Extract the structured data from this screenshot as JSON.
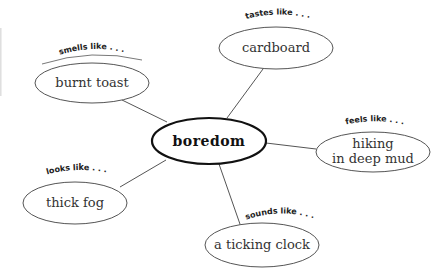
{
  "diagram": {
    "type": "concept-web",
    "center": {
      "label": "boredom",
      "cx": 209,
      "cy": 141,
      "rx": 57,
      "ry": 23
    },
    "nodes": [
      {
        "id": "smells",
        "prompt": "smells like . . .",
        "lines": [
          "burnt toast"
        ],
        "cx": 92,
        "cy": 83,
        "rx": 57,
        "ry": 20
      },
      {
        "id": "tastes",
        "prompt": "tastes like . . .",
        "lines": [
          "cardboard"
        ],
        "cx": 276,
        "cy": 48,
        "rx": 57,
        "ry": 21
      },
      {
        "id": "feels",
        "prompt": "feels like . . .",
        "lines": [
          "hiking",
          "in deep mud"
        ],
        "cx": 373,
        "cy": 152,
        "rx": 57,
        "ry": 20
      },
      {
        "id": "looks",
        "prompt": "looks like . . .",
        "lines": [
          "thick fog"
        ],
        "cx": 75,
        "cy": 203,
        "rx": 52,
        "ry": 21
      },
      {
        "id": "sounds",
        "prompt": "sounds like . . .",
        "lines": [
          "a ticking clock"
        ],
        "cx": 262,
        "cy": 245,
        "rx": 57,
        "ry": 22
      }
    ],
    "edges": [
      {
        "to": "smells",
        "x1": 167,
        "y1": 122,
        "x2": 122,
        "y2": 100
      },
      {
        "to": "tastes",
        "x1": 227,
        "y1": 118,
        "x2": 263,
        "y2": 69
      },
      {
        "to": "feels",
        "x1": 266,
        "y1": 143,
        "x2": 316,
        "y2": 149
      },
      {
        "to": "looks",
        "x1": 166,
        "y1": 160,
        "x2": 120,
        "y2": 187
      },
      {
        "to": "sounds",
        "x1": 219,
        "y1": 164,
        "x2": 241,
        "y2": 227
      }
    ],
    "colors": {
      "stroke": "#555555",
      "center_stroke": "#111111",
      "text": "#333333",
      "background": "#ffffff"
    }
  }
}
